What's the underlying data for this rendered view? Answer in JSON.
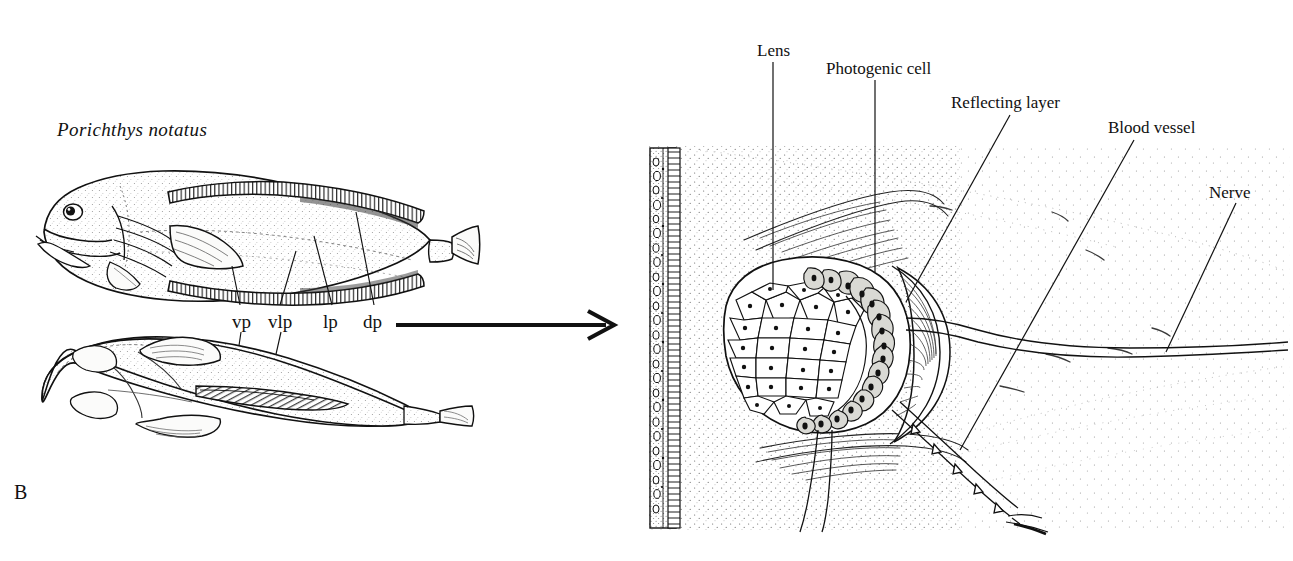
{
  "figure": {
    "panel_label": "B",
    "species_name": "Porichthys notatus"
  },
  "fish_labels": [
    {
      "id": "vp",
      "text": "vp",
      "x": 232,
      "y": 315,
      "meaning": "ventral photophores"
    },
    {
      "id": "vlp",
      "text": "vlp",
      "x": 268,
      "y": 315,
      "meaning": "ventrolateral photophores"
    },
    {
      "id": "lp",
      "text": "lp",
      "x": 323,
      "y": 315,
      "meaning": "lateral photophores"
    },
    {
      "id": "dp",
      "text": "dp",
      "x": 363,
      "y": 315,
      "meaning": "dorsal photophores"
    }
  ],
  "photophore_labels": [
    {
      "id": "lens",
      "text": "Lens",
      "x": 757,
      "y": 42
    },
    {
      "id": "photogenic-cell",
      "text": "Photogenic cell",
      "x": 826,
      "y": 60
    },
    {
      "id": "reflecting-layer",
      "text": "Reflecting layer",
      "x": 951,
      "y": 94
    },
    {
      "id": "blood-vessel",
      "text": "Blood vessel",
      "x": 1108,
      "y": 119
    },
    {
      "id": "nerve",
      "text": "Nerve",
      "x": 1209,
      "y": 184
    }
  ],
  "colors": {
    "ink": "#111111",
    "page": "#ffffff",
    "stipple": "#5a5a5a",
    "fill_light": "#f4f4f2",
    "fill_cell": "#d9d9d4"
  }
}
